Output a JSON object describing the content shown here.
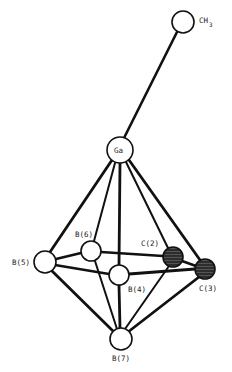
{
  "diagram": {
    "type": "molecular-structure",
    "colors": {
      "line": "#111111",
      "atom_fill": "#ffffff",
      "carbon_fill": "#3a3a3a"
    },
    "atoms": [
      {
        "id": "CH3",
        "label": "CH",
        "subscript": "3",
        "x": 183,
        "y": 22,
        "r": 11,
        "shaded": false
      },
      {
        "id": "Ga",
        "label": "Ga",
        "x": 120,
        "y": 150,
        "r": 13,
        "shaded": false
      },
      {
        "id": "B5",
        "label": "B(5)",
        "x": 45,
        "y": 262,
        "r": 11,
        "shaded": false
      },
      {
        "id": "B6",
        "label": "B(6)",
        "x": 91,
        "y": 251,
        "r": 10,
        "shaded": false
      },
      {
        "id": "B4",
        "label": "B(4)",
        "x": 119,
        "y": 275,
        "r": 10,
        "shaded": false
      },
      {
        "id": "C2",
        "label": "C(2)",
        "x": 173,
        "y": 257,
        "r": 10,
        "shaded": true
      },
      {
        "id": "C3",
        "label": "C(3)",
        "x": 205,
        "y": 269,
        "r": 10,
        "shaded": true
      },
      {
        "id": "B7",
        "label": "B(7)",
        "x": 121,
        "y": 339,
        "r": 11,
        "shaded": false
      }
    ],
    "labels": {
      "CH3": "CH",
      "CH3_sub": "3",
      "Ga": "Ga",
      "B5": "B(5)",
      "B6": "B(6)",
      "B4": "B(4)",
      "C2": "C(2)",
      "C3": "C(3)",
      "B7": "B(7)"
    },
    "bonds": [
      [
        "Ga",
        "CH3"
      ],
      [
        "Ga",
        "B5"
      ],
      [
        "Ga",
        "B6"
      ],
      [
        "Ga",
        "B4"
      ],
      [
        "Ga",
        "C2"
      ],
      [
        "Ga",
        "C3"
      ],
      [
        "B7",
        "B5"
      ],
      [
        "B7",
        "B6"
      ],
      [
        "B7",
        "B4"
      ],
      [
        "B7",
        "C2"
      ],
      [
        "B7",
        "C3"
      ],
      [
        "B5",
        "B6"
      ],
      [
        "B5",
        "B4"
      ],
      [
        "B6",
        "C2"
      ],
      [
        "B4",
        "C3"
      ],
      [
        "C2",
        "C3"
      ]
    ]
  }
}
